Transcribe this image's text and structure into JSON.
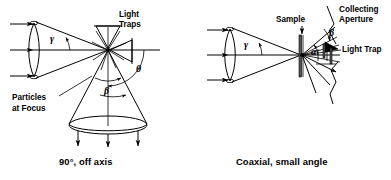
{
  "figure": {
    "background_color": "#ffffff",
    "ink_color": "#000000",
    "panels": [
      {
        "id": "left",
        "caption": "90°, off axis",
        "labels": {
          "light_traps": "Light\nTraps",
          "light_traps_line1": "Light",
          "light_traps_line2": "Traps",
          "particles_at_focus_line1": "Particles",
          "particles_at_focus_line2": "at Focus"
        },
        "angles": {
          "gamma": "γ",
          "theta": "θ",
          "beta": "β"
        },
        "components": [
          "input-beam-arrows",
          "focusing-lens",
          "convergence-cone",
          "focal-point",
          "light-trap-cone-up",
          "light-trap-cone-right",
          "collection-cone-down",
          "collection-aperture-ellipse",
          "output-arrows"
        ]
      },
      {
        "id": "right",
        "caption": "Coaxial, small angle",
        "labels": {
          "sample": "Sample",
          "collecting_aperture_line1": "Collecting",
          "collecting_aperture_line2": "Aperture",
          "light_trap": "Light Trap"
        },
        "angles": {
          "gamma": "γ",
          "alpha": "α",
          "beta": "β"
        },
        "components": [
          "input-beam-arrows",
          "focusing-lens",
          "convergence-cone",
          "sample-slab",
          "sample-arrow",
          "scattered-ray-fan",
          "light-trap-wedge",
          "collecting-aperture-plane",
          "detector-bars"
        ]
      }
    ]
  }
}
